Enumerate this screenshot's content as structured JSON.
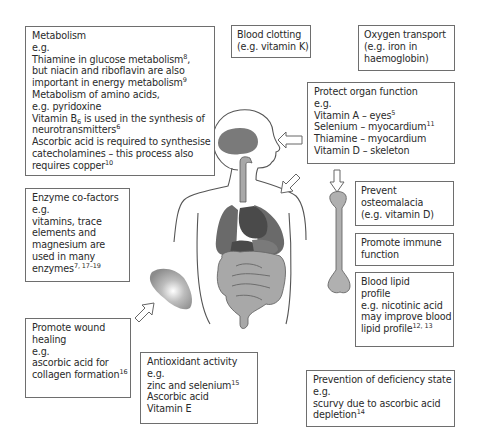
{
  "diagram": {
    "colors": {
      "box_border": "#6e6e6e",
      "organ_dark": "#4a4a4a",
      "organ_mid": "#7a7a7a",
      "organ_light": "#a8a8a8",
      "outline": "#555555"
    },
    "boxes": {
      "metabolism": {
        "lines": [
          {
            "text": "Metabolism"
          },
          {
            "text": "e.g."
          },
          {
            "text": "Thiamine in glucose metabolism",
            "sup": "8",
            "after": ","
          },
          {
            "text": "but niacin and riboflavin are also"
          },
          {
            "text": "important in energy metabolism",
            "sup": "9"
          },
          {
            "text": "Metabolism of amino acids,"
          },
          {
            "text": "e.g. pyridoxine"
          },
          {
            "text": "Vitamin B",
            "sub": "6",
            "after": " is used in the synthesis of"
          },
          {
            "text": "neurotransmitters",
            "sup": "6"
          },
          {
            "text": "Ascorbic acid is required to synthesise"
          },
          {
            "text": "catecholamines – this process also"
          },
          {
            "text": "requires copper",
            "sup": "10"
          }
        ]
      },
      "blood_clotting": {
        "lines": [
          {
            "text": "Blood clotting"
          },
          {
            "text": "(e.g. vitamin K)"
          }
        ]
      },
      "oxygen_transport": {
        "lines": [
          {
            "text": "Oxygen transport"
          },
          {
            "text": "(e.g. iron in"
          },
          {
            "text": "haemoglobin)"
          }
        ]
      },
      "protect_organ": {
        "lines": [
          {
            "text": "Protect organ function"
          },
          {
            "text": "e.g."
          },
          {
            "text": "Vitamin A – eyes",
            "sup": "5"
          },
          {
            "text": "Selenium – myocardium",
            "sup": "11"
          },
          {
            "text": "Thiamine – myocardium"
          },
          {
            "text": "Vitamin D – skeleton"
          }
        ]
      },
      "enzyme_cofactors": {
        "lines": [
          {
            "text": "Enzyme co-factors"
          },
          {
            "text": "e.g."
          },
          {
            "text": "vitamins, trace"
          },
          {
            "text": "elements and"
          },
          {
            "text": "magnesium are"
          },
          {
            "text": "used in many"
          },
          {
            "text": "enzymes",
            "sup": "7, 17–19"
          }
        ]
      },
      "osteomalacia": {
        "lines": [
          {
            "text": "Prevent"
          },
          {
            "text": "osteomalacia"
          },
          {
            "text": "(e.g. vitamin D)"
          }
        ]
      },
      "immune": {
        "lines": [
          {
            "text": "Promote immune"
          },
          {
            "text": "function"
          }
        ]
      },
      "blood_lipid": {
        "lines": [
          {
            "text": "Blood lipid"
          },
          {
            "text": "profile"
          },
          {
            "text": "e.g. nicotinic acid"
          },
          {
            "text": "may improve blood"
          },
          {
            "text": "lipid profile",
            "sup": "12, 13"
          }
        ]
      },
      "wound_healing": {
        "lines": [
          {
            "text": "Promote wound"
          },
          {
            "text": "healing"
          },
          {
            "text": "e.g."
          },
          {
            "text": "ascorbic acid for"
          },
          {
            "text": "collagen formation",
            "sup": "16"
          }
        ]
      },
      "antioxidant": {
        "lines": [
          {
            "text": "Antioxidant activity"
          },
          {
            "text": "e.g."
          },
          {
            "text": "zinc and selenium",
            "sup": "15"
          },
          {
            "text": "Ascorbic acid"
          },
          {
            "text": "Vitamin E"
          }
        ]
      },
      "deficiency": {
        "lines": [
          {
            "text": "Prevention of deficiency state"
          },
          {
            "text": "e.g."
          },
          {
            "text": "scurvy due to ascorbic acid"
          },
          {
            "text": "depletion",
            "sup": "14"
          }
        ]
      }
    },
    "figure": {
      "elements": [
        "human-torso-outline",
        "brain",
        "trachea",
        "lungs",
        "heart",
        "stomach",
        "liver",
        "intestines",
        "bone",
        "skin-wound-patch"
      ],
      "arrows": [
        "protect-organ-to-brain",
        "protect-organ-to-body",
        "protect-organ-to-bone",
        "wound-arrow-to-skin"
      ]
    }
  }
}
